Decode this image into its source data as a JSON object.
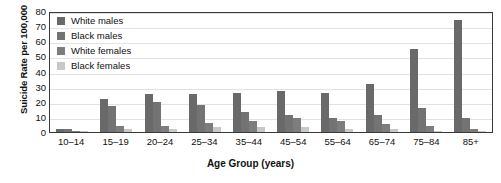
{
  "chart_data": {
    "type": "bar",
    "title": "",
    "xlabel": "Age Group (years)",
    "ylabel": "Suicide Rate per 100,000",
    "categories": [
      "10–14",
      "15–19",
      "20–24",
      "25–34",
      "35–44",
      "45–54",
      "55–64",
      "65–74",
      "75–84",
      "85+"
    ],
    "yticks": [
      0,
      10,
      20,
      30,
      40,
      50,
      60,
      70,
      80
    ],
    "ylim": [
      0,
      80
    ],
    "grid": true,
    "legend_position": "top-left",
    "series": [
      {
        "name": "White males",
        "color": "#696969",
        "values": [
          2,
          22,
          25,
          25,
          26,
          27,
          26,
          32,
          55,
          74
        ]
      },
      {
        "name": "Black males",
        "color": "#737373",
        "values": [
          2,
          17,
          20,
          18,
          13,
          11,
          9,
          11,
          16,
          9
        ]
      },
      {
        "name": "White females",
        "color": "#7d7d7d",
        "values": [
          1,
          4,
          4,
          6,
          7,
          9,
          7,
          5,
          4,
          2
        ]
      },
      {
        "name": "Black females",
        "color": "#c8c8c8",
        "values": [
          1,
          2,
          2,
          3,
          3,
          3,
          2,
          2,
          1,
          1
        ]
      }
    ]
  },
  "legend": {
    "items": [
      {
        "label": "White males"
      },
      {
        "label": "Black males"
      },
      {
        "label": "White females"
      },
      {
        "label": "Black females"
      }
    ]
  },
  "axes": {
    "y_title": "Suicide Rate per 100,000",
    "x_title": "Age Group (years)"
  }
}
